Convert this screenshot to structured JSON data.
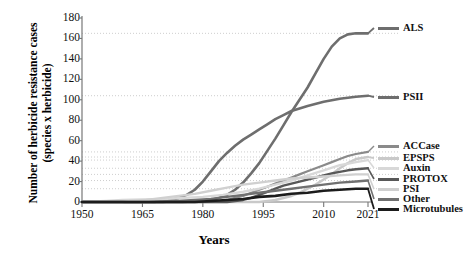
{
  "chart_data": {
    "type": "line",
    "title": "",
    "xlabel": "Years",
    "ylabel_line1": "Number of herbicide resistance cases",
    "ylabel_line2": "(species x herbicide)",
    "xlim": [
      1950,
      2021
    ],
    "ylim": [
      0,
      180
    ],
    "xticks": [
      "1950",
      "1965",
      "1980",
      "1995",
      "2010",
      "2021"
    ],
    "xtick_values": [
      1950,
      1965,
      1980,
      1995,
      2010,
      2021
    ],
    "yticks": [
      "0",
      "20",
      "40",
      "60",
      "80",
      "100",
      "120",
      "140",
      "160",
      "180"
    ],
    "ytick_values": [
      0,
      20,
      40,
      60,
      80,
      100,
      120,
      140,
      160,
      180
    ],
    "grid": "horizontal-dotted-at-series-endpoints",
    "legend_position": "right",
    "series": [
      {
        "name": "ALS",
        "color": "#6e6e6e",
        "width": 2.6,
        "label_y": 28,
        "final_value": 165,
        "x": [
          1950,
          1975,
          1980,
          1982,
          1984,
          1986,
          1988,
          1990,
          1992,
          1994,
          1996,
          1998,
          2000,
          2002,
          2004,
          2006,
          2008,
          2010,
          2012,
          2014,
          2016,
          2018,
          2021
        ],
        "values": [
          0,
          0,
          1,
          2,
          4,
          7,
          12,
          19,
          28,
          38,
          50,
          62,
          75,
          88,
          100,
          112,
          126,
          140,
          152,
          160,
          164,
          165,
          165
        ]
      },
      {
        "name": "PSII",
        "color": "#6e6e6e",
        "width": 2.6,
        "label_y": 97,
        "final_value": 104,
        "x": [
          1950,
          1968,
          1970,
          1972,
          1974,
          1976,
          1978,
          1980,
          1982,
          1984,
          1986,
          1988,
          1990,
          1992,
          1994,
          1996,
          1998,
          2000,
          2002,
          2006,
          2010,
          2014,
          2018,
          2021
        ],
        "values": [
          0,
          0,
          1,
          2,
          4,
          7,
          12,
          20,
          30,
          40,
          48,
          55,
          61,
          66,
          71,
          76,
          81,
          85,
          89,
          94,
          98,
          101,
          103,
          104
        ]
      },
      {
        "name": "ACCase",
        "color": "#8a8a8a",
        "width": 2.2,
        "label_y": 146,
        "final_value": 49,
        "x": [
          1950,
          1982,
          1984,
          1986,
          1988,
          1990,
          1992,
          1994,
          1996,
          1998,
          2000,
          2002,
          2004,
          2006,
          2008,
          2010,
          2012,
          2014,
          2016,
          2018,
          2021
        ],
        "values": [
          0,
          0,
          1,
          2,
          4,
          6,
          9,
          12,
          15,
          18,
          21,
          24,
          27,
          30,
          33,
          36,
          39,
          42,
          45,
          47,
          49
        ]
      },
      {
        "name": "EPSPS",
        "color": "#c9c9c9",
        "width": 2.6,
        "label_y": 158,
        "final_value": 44,
        "x": [
          1950,
          1994,
          1996,
          1998,
          2000,
          2002,
          2004,
          2006,
          2008,
          2010,
          2012,
          2014,
          2016,
          2018,
          2021
        ],
        "values": [
          0,
          0,
          1,
          2,
          4,
          6,
          9,
          13,
          17,
          22,
          27,
          33,
          38,
          42,
          44
        ]
      },
      {
        "name": "Auxin",
        "color": "#d8d8d8",
        "width": 2.4,
        "label_y": 168,
        "final_value": 41,
        "x": [
          1950,
          1956,
          1960,
          1970,
          1980,
          1985,
          1990,
          1994,
          1998,
          2002,
          2006,
          2010,
          2014,
          2018,
          2021
        ],
        "values": [
          0,
          1,
          2,
          3,
          5,
          7,
          10,
          13,
          17,
          21,
          26,
          31,
          36,
          39,
          41
        ]
      },
      {
        "name": "PROTOX",
        "color": "#585858",
        "width": 2.4,
        "label_y": 179,
        "final_value": 33,
        "x": [
          1950,
          1986,
          1988,
          1990,
          1992,
          1994,
          1996,
          1998,
          2000,
          2004,
          2008,
          2012,
          2016,
          2018,
          2021
        ],
        "values": [
          0,
          0,
          1,
          2,
          4,
          7,
          10,
          13,
          16,
          20,
          24,
          28,
          31,
          32,
          33
        ]
      },
      {
        "name": "PSI",
        "color": "#d0d0d0",
        "width": 2.4,
        "label_y": 189,
        "final_value": 27,
        "x": [
          1950,
          1960,
          1962,
          1966,
          1970,
          1974,
          1978,
          1982,
          1986,
          1990,
          1994,
          1998,
          2002,
          2006,
          2010,
          2014,
          2018,
          2021
        ],
        "values": [
          0,
          0,
          1,
          2,
          4,
          6,
          8,
          11,
          14,
          17,
          19,
          21,
          23,
          24,
          25,
          26,
          27,
          27
        ]
      },
      {
        "name": "Other",
        "color": "#707070",
        "width": 2.4,
        "label_y": 199,
        "final_value": 21,
        "x": [
          1950,
          1970,
          1974,
          1978,
          1982,
          1986,
          1990,
          1994,
          1998,
          2002,
          2006,
          2010,
          2014,
          2018,
          2021
        ],
        "values": [
          0,
          0,
          1,
          2,
          3,
          5,
          7,
          9,
          11,
          13,
          15,
          17,
          19,
          20,
          21
        ]
      },
      {
        "name": "Microtubules",
        "color": "#1c1c1c",
        "width": 2.6,
        "label_y": 209,
        "final_value": 13,
        "x": [
          1950,
          1978,
          1982,
          1986,
          1990,
          1994,
          1998,
          2002,
          2006,
          2010,
          2014,
          2018,
          2021
        ],
        "values": [
          0,
          0,
          1,
          2,
          3,
          5,
          6,
          8,
          9,
          11,
          12,
          13,
          13
        ]
      }
    ],
    "gridline_values": [
      165,
      104,
      49,
      44,
      41,
      33,
      27,
      21,
      13
    ]
  }
}
